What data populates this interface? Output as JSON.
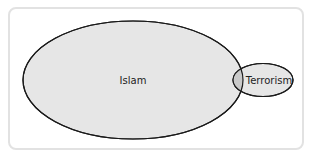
{
  "diagram": {
    "type": "venn",
    "sets": [
      {
        "id": "islam",
        "label": "Islam",
        "fill": "#e6e6e6"
      },
      {
        "id": "terrorism",
        "label": "Terrorism",
        "fill": "#e6e6e6"
      }
    ],
    "overlap_fill": "#c9c9c9",
    "stroke": "#1a1a1a",
    "frame_border": "#e2e2e2"
  }
}
